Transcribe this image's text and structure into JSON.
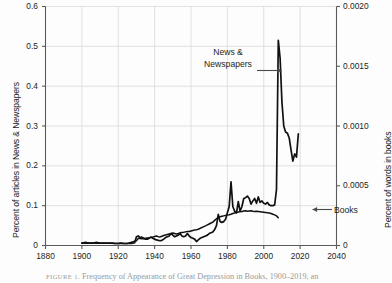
{
  "figure": {
    "caption_label": "FIGURE 1.",
    "caption_text": "Frequency of Appearance of Great Depression in Books, 1900–2019, an"
  },
  "axes": {
    "left": {
      "title": "Percent of articles in News & Newspapers",
      "ticks": [
        "0",
        "0.1",
        "0.2",
        "0.3",
        "0.4",
        "0.5",
        "0.6"
      ],
      "tick_values": [
        0,
        0.1,
        0.2,
        0.3,
        0.4,
        0.5,
        0.6
      ],
      "min": 0,
      "max": 0.6
    },
    "right": {
      "title": "Percent of words in books",
      "ticks": [
        "0",
        "0.0005",
        "0.0010",
        "0.0015",
        "0.0020"
      ],
      "tick_values": [
        0,
        0.0005,
        0.001,
        0.0015,
        0.002
      ],
      "min": 0,
      "max": 0.002
    },
    "bottom": {
      "title": "",
      "ticks": [
        "1880",
        "1900",
        "1920",
        "1940",
        "1960",
        "1980",
        "2000",
        "2020",
        "2040"
      ],
      "tick_values": [
        1880,
        1900,
        1920,
        1940,
        1960,
        1980,
        2000,
        2020,
        2040
      ],
      "min": 1880,
      "max": 2040
    }
  },
  "annotations": [
    {
      "name": "news-newspapers",
      "line1": "News &",
      "line2": "Newspapers",
      "arrow": "right"
    },
    {
      "name": "books",
      "text": "Books",
      "arrow": "left"
    }
  ],
  "colors": {
    "line": "#111111",
    "grid": "#d9d9d9",
    "axis": "#5a5a5a",
    "text": "#231f20",
    "background": "#fdfdfd"
  },
  "chart_data": {
    "type": "line",
    "title": "",
    "xlabel": "",
    "ylabel": "Percent of articles in News & Newspapers",
    "y2label": "Percent of words in books",
    "xlim": [
      1880,
      2040
    ],
    "ylim": [
      0,
      0.6
    ],
    "y2lim": [
      0,
      0.002
    ],
    "grid": true,
    "legend": "annotations-inline",
    "series": [
      {
        "name": "News & Newspapers",
        "axis": "left",
        "x": [
          1900,
          1901,
          1902,
          1903,
          1904,
          1905,
          1906,
          1907,
          1908,
          1909,
          1910,
          1911,
          1912,
          1913,
          1914,
          1915,
          1916,
          1917,
          1918,
          1919,
          1920,
          1921,
          1922,
          1923,
          1924,
          1925,
          1926,
          1927,
          1928,
          1929,
          1930,
          1931,
          1932,
          1933,
          1934,
          1935,
          1936,
          1937,
          1938,
          1939,
          1940,
          1941,
          1942,
          1943,
          1944,
          1945,
          1946,
          1947,
          1948,
          1949,
          1950,
          1951,
          1952,
          1953,
          1954,
          1955,
          1956,
          1957,
          1958,
          1959,
          1960,
          1961,
          1962,
          1963,
          1964,
          1965,
          1966,
          1967,
          1968,
          1969,
          1970,
          1971,
          1972,
          1973,
          1974,
          1975,
          1976,
          1977,
          1978,
          1979,
          1980,
          1981,
          1982,
          1983,
          1984,
          1985,
          1986,
          1987,
          1988,
          1989,
          1990,
          1991,
          1992,
          1993,
          1994,
          1995,
          1996,
          1997,
          1998,
          1999,
          2000,
          2001,
          2002,
          2003,
          2004,
          2005,
          2006,
          2007,
          2008,
          2009,
          2010,
          2011,
          2012,
          2013,
          2014,
          2015,
          2016,
          2017,
          2018,
          2019
        ],
        "values": [
          0.006,
          0.007,
          0.008,
          0.007,
          0.006,
          0.006,
          0.006,
          0.007,
          0.008,
          0.007,
          0.006,
          0.006,
          0.006,
          0.006,
          0.006,
          0.006,
          0.006,
          0.006,
          0.005,
          0.005,
          0.005,
          0.006,
          0.006,
          0.005,
          0.005,
          0.005,
          0.005,
          0.005,
          0.006,
          0.007,
          0.022,
          0.024,
          0.02,
          0.021,
          0.018,
          0.016,
          0.016,
          0.018,
          0.021,
          0.018,
          0.016,
          0.014,
          0.013,
          0.012,
          0.013,
          0.016,
          0.02,
          0.022,
          0.024,
          0.03,
          0.026,
          0.022,
          0.024,
          0.026,
          0.03,
          0.024,
          0.022,
          0.024,
          0.03,
          0.024,
          0.02,
          0.018,
          0.016,
          0.01,
          0.014,
          0.018,
          0.02,
          0.022,
          0.024,
          0.026,
          0.03,
          0.032,
          0.034,
          0.04,
          0.05,
          0.078,
          0.06,
          0.058,
          0.06,
          0.066,
          0.082,
          0.098,
          0.16,
          0.098,
          0.086,
          0.082,
          0.11,
          0.086,
          0.098,
          0.118,
          0.12,
          0.124,
          0.118,
          0.104,
          0.112,
          0.118,
          0.106,
          0.122,
          0.108,
          0.112,
          0.106,
          0.104,
          0.108,
          0.102,
          0.1,
          0.1,
          0.102,
          0.14,
          0.515,
          0.47,
          0.36,
          0.3,
          0.285,
          0.282,
          0.27,
          0.24,
          0.212,
          0.23,
          0.222,
          0.28
        ]
      },
      {
        "name": "Books",
        "axis": "right",
        "x": [
          1900,
          1905,
          1910,
          1915,
          1920,
          1925,
          1930,
          1931,
          1932,
          1933,
          1934,
          1935,
          1936,
          1937,
          1938,
          1939,
          1940,
          1941,
          1942,
          1943,
          1944,
          1945,
          1946,
          1947,
          1948,
          1949,
          1950,
          1951,
          1952,
          1953,
          1954,
          1955,
          1956,
          1957,
          1958,
          1959,
          1960,
          1961,
          1962,
          1963,
          1964,
          1965,
          1966,
          1967,
          1968,
          1969,
          1970,
          1971,
          1972,
          1973,
          1974,
          1975,
          1976,
          1977,
          1978,
          1979,
          1980,
          1981,
          1982,
          1983,
          1984,
          1985,
          1986,
          1987,
          1988,
          1989,
          1990,
          1991,
          1992,
          1993,
          1994,
          1995,
          1996,
          1997,
          1998,
          1999,
          2000,
          2001,
          2002,
          2003,
          2004,
          2005,
          2006,
          2007,
          2008
        ],
        "values": [
          1.8e-05,
          2e-05,
          1.8e-05,
          1.8e-05,
          1.6e-05,
          1.6e-05,
          4e-05,
          6e-05,
          5.8e-05,
          5.6e-05,
          5.6e-05,
          6e-05,
          6.2e-05,
          6.4e-05,
          7e-05,
          7.2e-05,
          7.6e-05,
          8e-05,
          7.4e-05,
          7.2e-05,
          7.8e-05,
          8.4e-05,
          8.8e-05,
          9.2e-05,
          9.6e-05,
          0.0001,
          0.000104,
          0.0001,
          9.6e-05,
          0.0001,
          0.000106,
          0.000108,
          0.00011,
          0.000114,
          0.000118,
          0.000118,
          0.000122,
          0.000126,
          0.00013,
          0.000132,
          0.000136,
          0.000144,
          0.00015,
          0.000158,
          0.000164,
          0.000172,
          0.00018,
          0.000188,
          0.000196,
          0.00021,
          0.000224,
          0.000236,
          0.00024,
          0.000244,
          0.000248,
          0.000252,
          0.000256,
          0.000258,
          0.000262,
          0.000268,
          0.000272,
          0.000276,
          0.00028,
          0.000282,
          0.000284,
          0.000288,
          0.00029,
          0.000286,
          0.000288,
          0.00029,
          0.000286,
          0.000284,
          0.000286,
          0.000284,
          0.000282,
          0.00028,
          0.000278,
          0.000276,
          0.000274,
          0.000272,
          0.000268,
          0.000262,
          0.000256,
          0.000248,
          0.000232
        ]
      }
    ]
  }
}
